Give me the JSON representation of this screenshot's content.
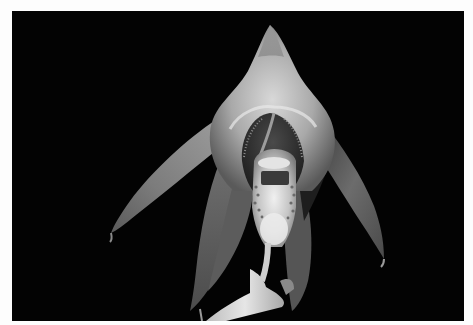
{
  "image": {
    "subject": "orchid flower",
    "style": "grayscale photograph",
    "background_color": "#030303",
    "border_color": "#fdfdfd",
    "photo_bounds": {
      "x": 12,
      "y": 11,
      "width": 452,
      "height": 310
    },
    "parts": [
      {
        "name": "dorsal-sepal",
        "description": "hooded pointed top sepal"
      },
      {
        "name": "left-petal",
        "description": "long narrow curved petal to lower left"
      },
      {
        "name": "right-petal",
        "description": "long narrow curved petal to lower right"
      },
      {
        "name": "lip",
        "description": "pale lip with spotted callus in center"
      },
      {
        "name": "lateral-sepals",
        "description": "dark textured sepals hanging below"
      },
      {
        "name": "stem",
        "description": "pale pedicel at bottom"
      }
    ]
  }
}
